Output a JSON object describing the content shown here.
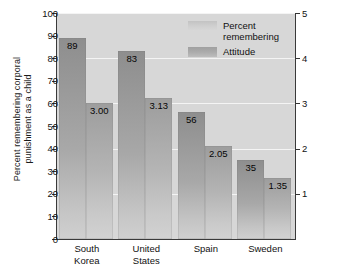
{
  "chart_data": {
    "type": "bar",
    "title": "",
    "subtitle": "",
    "xlabel": "",
    "ylabel": "Percent remembering corporal punishment as a child",
    "ylabel_line1": "Percent remembering corporal",
    "ylabel_line2": "punishment as a child",
    "y2label": "Attitude toward use of corporal punishment",
    "categories": [
      "South Korea",
      "United States",
      "Spain",
      "Sweden"
    ],
    "category_lines": [
      [
        "South",
        "Korea"
      ],
      [
        "United",
        "States"
      ],
      [
        "Spain",
        ""
      ],
      [
        "Sweden",
        ""
      ]
    ],
    "series": [
      {
        "name": "Percent remembering",
        "axis": "left",
        "values": [
          89,
          83,
          56,
          35
        ],
        "labels": [
          "89",
          "83",
          "56",
          "35"
        ],
        "color": "#a8a8a8"
      },
      {
        "name": "Attitude",
        "axis": "right",
        "values": [
          3.0,
          3.13,
          2.05,
          1.35
        ],
        "labels": [
          "3.00",
          "3.13",
          "2.05",
          "1.35"
        ],
        "color": "#b4b4b4"
      }
    ],
    "ylim": [
      0,
      100
    ],
    "y2lim": [
      0,
      5
    ],
    "yticks": [
      0,
      10,
      20,
      30,
      40,
      50,
      60,
      70,
      80,
      90,
      100
    ],
    "ytick_labels": [
      "0",
      "10",
      "20",
      "30",
      "40",
      "50",
      "60",
      "70",
      "80",
      "90",
      "100"
    ],
    "y2ticks": [
      1,
      2,
      3,
      4,
      5
    ],
    "y2tick_labels": [
      "1",
      "2",
      "3",
      "4",
      "5"
    ],
    "grid": true,
    "gridline_values": [
      20,
      40,
      60,
      80,
      100
    ],
    "legend_position": "top-right-inside",
    "plot_background": "#d7d7d7",
    "gridline_color": "#f4f4f4",
    "axis_color": "#3a3a3a",
    "text_color": "#111111"
  },
  "legend": {
    "entries": [
      {
        "label_line1": "Percent",
        "label_line2": "remembering"
      },
      {
        "label_line1": "Attitude",
        "label_line2": ""
      }
    ]
  }
}
